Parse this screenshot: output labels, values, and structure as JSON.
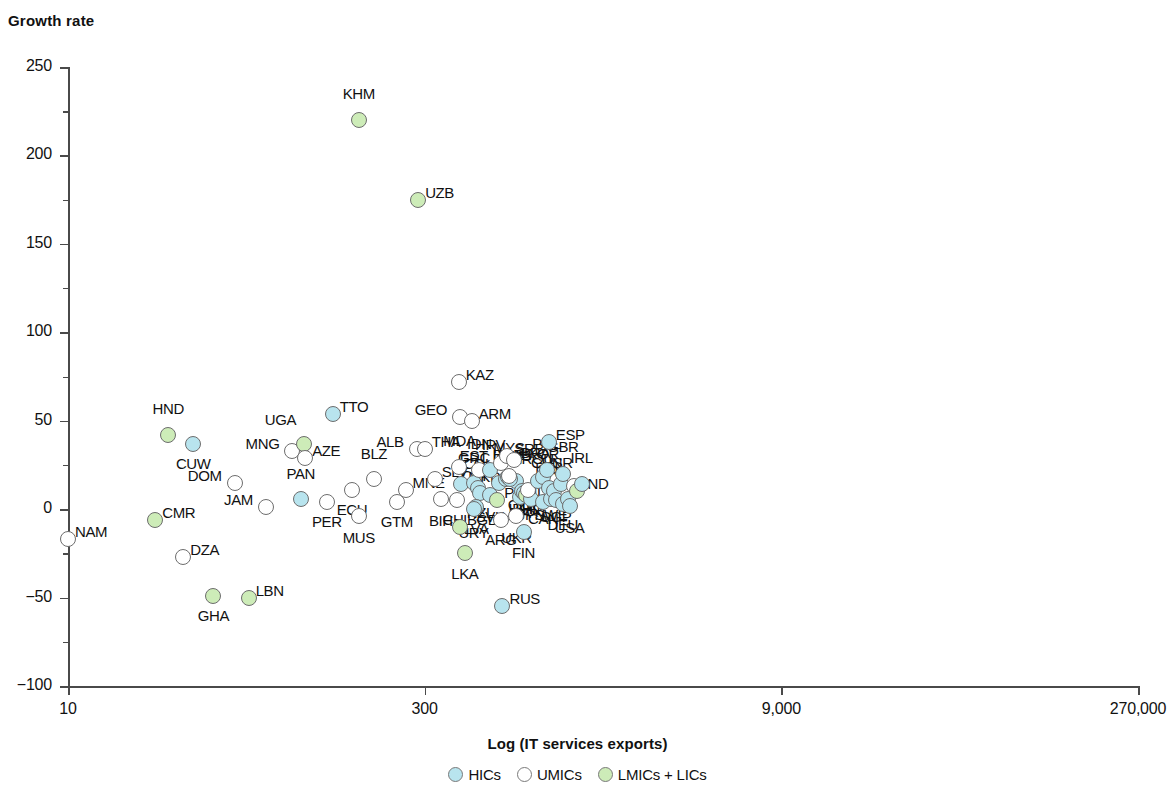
{
  "chart_data": {
    "type": "scatter",
    "title": "",
    "ylabel": "Growth rate",
    "xlabel": "Log (IT services exports)",
    "ylim": [
      -100,
      250
    ],
    "ytick_labels": [
      "250",
      "200",
      "150",
      "100",
      "50",
      "0",
      "-50",
      "-100"
    ],
    "ytick_values": [
      250,
      200,
      150,
      100,
      50,
      0,
      -50,
      -100
    ],
    "xtick_labels": [
      "10",
      "300",
      "9,000",
      "270,000"
    ],
    "xtick_values": [
      10,
      300,
      9000,
      270000
    ],
    "x_scale": "log",
    "grid": false,
    "legend_position": "bottom-center",
    "legend": [
      {
        "name": "HICs",
        "color": "#b8e4ee"
      },
      {
        "name": "UMICs",
        "color": "#ffffff"
      },
      {
        "name": "LMICs + LICs",
        "color": "#cdecb8"
      }
    ],
    "points": [
      {
        "code": "NAM",
        "x": 10,
        "y": -17,
        "g": "UMICs",
        "lx": -3,
        "ly": -7,
        "anchor": "left"
      },
      {
        "code": "CMR",
        "x": 23,
        "y": -6,
        "g": "LMICs + LICs",
        "lx": -3,
        "ly": -7,
        "anchor": "left"
      },
      {
        "code": "HND",
        "x": 26,
        "y": 42,
        "g": "LMICs + LICs",
        "lx": 0,
        "ly": -26,
        "anchor": "center"
      },
      {
        "code": "CUW",
        "x": 33,
        "y": 37,
        "g": "HICs",
        "lx": 0,
        "ly": 20,
        "anchor": "center"
      },
      {
        "code": "DZA",
        "x": 30,
        "y": -27,
        "g": "UMICs",
        "lx": -3,
        "ly": -7,
        "anchor": "left"
      },
      {
        "code": "GHA",
        "x": 40,
        "y": -49,
        "g": "LMICs + LICs",
        "lx": 0,
        "ly": 20,
        "anchor": "center"
      },
      {
        "code": "LBN",
        "x": 56,
        "y": -50,
        "g": "LMICs + LICs",
        "lx": -3,
        "ly": -7,
        "anchor": "left"
      },
      {
        "code": "DOM",
        "x": 49,
        "y": 15,
        "g": "UMICs",
        "lx": 3,
        "ly": -7,
        "anchor": "right"
      },
      {
        "code": "JAM",
        "x": 66,
        "y": 1,
        "g": "UMICs",
        "lx": 3,
        "ly": -7,
        "anchor": "right"
      },
      {
        "code": "MNG",
        "x": 85,
        "y": 33,
        "g": "UMICs",
        "lx": 3,
        "ly": -7,
        "anchor": "right"
      },
      {
        "code": "UGA",
        "x": 95,
        "y": 37,
        "g": "LMICs + LICs",
        "lx": -2,
        "ly": -24,
        "anchor": "right"
      },
      {
        "code": "AZE",
        "x": 96,
        "y": 29,
        "g": "UMICs",
        "lx": -3,
        "ly": -7,
        "anchor": "left"
      },
      {
        "code": "PAN",
        "x": 92,
        "y": 6,
        "g": "HICs",
        "lx": 0,
        "ly": -25,
        "anchor": "center"
      },
      {
        "code": "TTO",
        "x": 125,
        "y": 54,
        "g": "HICs",
        "lx": -3,
        "ly": -7,
        "anchor": "left"
      },
      {
        "code": "PER",
        "x": 118,
        "y": 4,
        "g": "UMICs",
        "lx": 0,
        "ly": 20,
        "anchor": "center"
      },
      {
        "code": "ECU",
        "x": 150,
        "y": 11,
        "g": "UMICs",
        "lx": 0,
        "ly": 20,
        "anchor": "center"
      },
      {
        "code": "MUS",
        "x": 160,
        "y": -4,
        "g": "UMICs",
        "lx": 0,
        "ly": 22,
        "anchor": "center"
      },
      {
        "code": "BLZ",
        "x": 185,
        "y": 17,
        "g": "UMICs",
        "lx": 0,
        "ly": -25,
        "anchor": "center"
      },
      {
        "code": "GTM",
        "x": 230,
        "y": 4,
        "g": "UMICs",
        "lx": 0,
        "ly": 20,
        "anchor": "center"
      },
      {
        "code": "MNE",
        "x": 250,
        "y": 11,
        "g": "UMICs",
        "lx": -3,
        "ly": -7,
        "anchor": "left"
      },
      {
        "code": "ALB",
        "x": 278,
        "y": 34,
        "g": "UMICs",
        "lx": 3,
        "ly": -7,
        "anchor": "right"
      },
      {
        "code": "THA",
        "x": 300,
        "y": 34,
        "g": "UMICs",
        "lx": -3,
        "ly": -7,
        "anchor": "left"
      },
      {
        "code": "KHM",
        "x": 160,
        "y": 220,
        "g": "LMICs + LICs",
        "lx": 0,
        "ly": -26,
        "anchor": "center"
      },
      {
        "code": "UZB",
        "x": 282,
        "y": 175,
        "g": "LMICs + LICs",
        "lx": -3,
        "ly": -7,
        "anchor": "left"
      },
      {
        "code": "SLV",
        "x": 330,
        "y": 17,
        "g": "UMICs",
        "lx": -3,
        "ly": -7,
        "anchor": "left"
      },
      {
        "code": "BIH",
        "x": 350,
        "y": 6,
        "g": "UMICs",
        "lx": 0,
        "ly": 22,
        "anchor": "center"
      },
      {
        "code": "KAZ",
        "x": 415,
        "y": 72,
        "g": "UMICs",
        "lx": -3,
        "ly": -7,
        "anchor": "left"
      },
      {
        "code": "GEO",
        "x": 420,
        "y": 52,
        "g": "UMICs",
        "lx": 3,
        "ly": -7,
        "anchor": "right"
      },
      {
        "code": "MDA",
        "x": 418,
        "y": 24,
        "g": "UMICs",
        "lx": 0,
        "ly": -26,
        "anchor": "center"
      },
      {
        "code": "MKD",
        "x": 425,
        "y": 14,
        "g": "HICs",
        "lx": -3,
        "ly": -7,
        "anchor": "left"
      },
      {
        "code": "CHL",
        "x": 408,
        "y": 5,
        "g": "UMICs",
        "lx": 0,
        "ly": 20,
        "anchor": "center"
      },
      {
        "code": "BGD",
        "x": 420,
        "y": -10,
        "g": "LMICs + LICs",
        "lx": -3,
        "ly": -7,
        "anchor": "left"
      },
      {
        "code": "LKA",
        "x": 440,
        "y": -25,
        "g": "LMICs + LICs",
        "lx": 0,
        "ly": 21,
        "anchor": "center"
      },
      {
        "code": "ARM",
        "x": 470,
        "y": 50,
        "g": "UMICs",
        "lx": -3,
        "ly": -7,
        "anchor": "left"
      },
      {
        "code": "GRC",
        "x": 480,
        "y": 15,
        "g": "HICs",
        "lx": 0,
        "ly": -25,
        "anchor": "center"
      },
      {
        "code": "IDN",
        "x": 505,
        "y": 22,
        "g": "UMICs",
        "lx": 0,
        "ly": -26,
        "anchor": "center"
      },
      {
        "code": "COL",
        "x": 500,
        "y": 12,
        "g": "HICs",
        "lx": 0,
        "ly": -24,
        "anchor": "center"
      },
      {
        "code": "NZL",
        "x": 510,
        "y": 9,
        "g": "HICs",
        "lx": 0,
        "ly": 20,
        "anchor": "center"
      },
      {
        "code": "LVA",
        "x": 490,
        "y": 1,
        "g": "HICs",
        "lx": 0,
        "ly": 22,
        "anchor": "center"
      },
      {
        "code": "URY",
        "x": 478,
        "y": 0,
        "g": "HICs",
        "lx": 0,
        "ly": 24,
        "anchor": "center"
      },
      {
        "code": "HRV",
        "x": 560,
        "y": 22,
        "g": "HICs",
        "lx": 0,
        "ly": -25,
        "anchor": "center"
      },
      {
        "code": "SVK",
        "x": 560,
        "y": 8,
        "g": "HICs",
        "lx": 0,
        "ly": 22,
        "anchor": "center"
      },
      {
        "code": "EST",
        "x": 620,
        "y": 26,
        "g": "UMICs",
        "lx": 3,
        "ly": -7,
        "anchor": "right"
      },
      {
        "code": "SRB",
        "x": 660,
        "y": 30,
        "g": "UMICs",
        "lx": -3,
        "ly": -7,
        "anchor": "left"
      },
      {
        "code": "CRI",
        "x": 610,
        "y": 15,
        "g": "HICs",
        "lx": 3,
        "ly": -7,
        "anchor": "right"
      },
      {
        "code": "PAK",
        "x": 600,
        "y": 5,
        "g": "LMICs + LICs",
        "lx": -3,
        "ly": -7,
        "anchor": "left"
      },
      {
        "code": "ARG",
        "x": 620,
        "y": -6,
        "g": "UMICs",
        "lx": 0,
        "ly": 20,
        "anchor": "center"
      },
      {
        "code": "BRA",
        "x": 700,
        "y": 28,
        "g": "UMICs",
        "lx": -3,
        "ly": -7,
        "anchor": "left"
      },
      {
        "code": "AUS",
        "x": 720,
        "y": 16,
        "g": "HICs",
        "lx": 0,
        "ly": -25,
        "anchor": "center"
      },
      {
        "code": "LTU",
        "x": 650,
        "y": 17,
        "g": "HICs",
        "lx": 0,
        "ly": -24,
        "anchor": "center"
      },
      {
        "code": "BGR",
        "x": 665,
        "y": 18,
        "g": "HICs",
        "lx": 0,
        "ly": -22,
        "anchor": "center"
      },
      {
        "code": "PRT",
        "x": 680,
        "y": 17,
        "g": "HICs",
        "lx": 0,
        "ly": -20,
        "anchor": "center"
      },
      {
        "code": "MYS",
        "x": 670,
        "y": 19,
        "g": "UMICs",
        "lx": 0,
        "ly": -28,
        "anchor": "center"
      },
      {
        "code": "UKR",
        "x": 720,
        "y": -4,
        "g": "UMICs",
        "lx": 0,
        "ly": 22,
        "anchor": "center"
      },
      {
        "code": "FIN",
        "x": 770,
        "y": -13,
        "g": "HICs",
        "lx": 0,
        "ly": 21,
        "anchor": "center"
      },
      {
        "code": "ITA",
        "x": 745,
        "y": 7,
        "g": "HICs",
        "lx": 0,
        "ly": 16,
        "anchor": "center"
      },
      {
        "code": "CZE",
        "x": 760,
        "y": 10,
        "g": "HICs",
        "lx": 0,
        "ly": 14,
        "anchor": "center"
      },
      {
        "code": "HUN",
        "x": 775,
        "y": 9,
        "g": "HICs",
        "lx": 0,
        "ly": 16,
        "anchor": "center"
      },
      {
        "code": "PHL",
        "x": 790,
        "y": 8,
        "g": "LMICs + LICs",
        "lx": 0,
        "ly": 14,
        "anchor": "center"
      },
      {
        "code": "JPN",
        "x": 830,
        "y": 6,
        "g": "HICs",
        "lx": 0,
        "ly": 16,
        "anchor": "center"
      },
      {
        "code": "TUR",
        "x": 800,
        "y": 11,
        "g": "UMICs",
        "lx": 0,
        "ly": 15,
        "anchor": "center"
      },
      {
        "code": "ROU",
        "x": 880,
        "y": 16,
        "g": "HICs",
        "lx": 0,
        "ly": -22,
        "anchor": "center"
      },
      {
        "code": "KOR",
        "x": 930,
        "y": 18,
        "g": "HICs",
        "lx": 0,
        "ly": -23,
        "anchor": "center"
      },
      {
        "code": "POL",
        "x": 960,
        "y": 22,
        "g": "HICs",
        "lx": 0,
        "ly": -26,
        "anchor": "center"
      },
      {
        "code": "ESP",
        "x": 980,
        "y": 38,
        "g": "HICs",
        "lx": -3,
        "ly": -7,
        "anchor": "left"
      },
      {
        "code": "BEL",
        "x": 980,
        "y": 12,
        "g": "HICs",
        "lx": 0,
        "ly": -20,
        "anchor": "center"
      },
      {
        "code": "CAN",
        "x": 930,
        "y": 4,
        "g": "HICs",
        "lx": 0,
        "ly": 17,
        "anchor": "center"
      },
      {
        "code": "SWE",
        "x": 1000,
        "y": 6,
        "g": "HICs",
        "lx": 0,
        "ly": 16,
        "anchor": "center"
      },
      {
        "code": "FRA",
        "x": 1030,
        "y": 10,
        "g": "HICs",
        "lx": 0,
        "ly": -19,
        "anchor": "center"
      },
      {
        "code": "SGP",
        "x": 1050,
        "y": 5,
        "g": "HICs",
        "lx": 0,
        "ly": 17,
        "anchor": "center"
      },
      {
        "code": "ISR",
        "x": 1100,
        "y": 14,
        "g": "HICs",
        "lx": 0,
        "ly": -21,
        "anchor": "center"
      },
      {
        "code": "GBR",
        "x": 1120,
        "y": 20,
        "g": "HICs",
        "lx": 0,
        "ly": -27,
        "anchor": "center"
      },
      {
        "code": "DEU",
        "x": 1120,
        "y": 3,
        "g": "HICs",
        "lx": 0,
        "ly": 21,
        "anchor": "center"
      },
      {
        "code": "NLD",
        "x": 1180,
        "y": 6,
        "g": "HICs",
        "lx": 3,
        "ly": -7,
        "anchor": "right"
      },
      {
        "code": "USA",
        "x": 1195,
        "y": 2,
        "g": "HICs",
        "lx": 0,
        "ly": 22,
        "anchor": "center"
      },
      {
        "code": "CHN",
        "x": 1250,
        "y": 13,
        "g": "UMICs",
        "lx": 2,
        "ly": -23,
        "anchor": "right"
      },
      {
        "code": "IND",
        "x": 1280,
        "y": 10,
        "g": "LMICs + LICs",
        "lx": -3,
        "ly": -7,
        "anchor": "left"
      },
      {
        "code": "IRL",
        "x": 1340,
        "y": 14,
        "g": "HICs",
        "lx": 0,
        "ly": -26,
        "anchor": "center"
      },
      {
        "code": "RUS",
        "x": 630,
        "y": -55,
        "g": "HICs",
        "lx": -3,
        "ly": -7,
        "anchor": "left"
      }
    ]
  }
}
